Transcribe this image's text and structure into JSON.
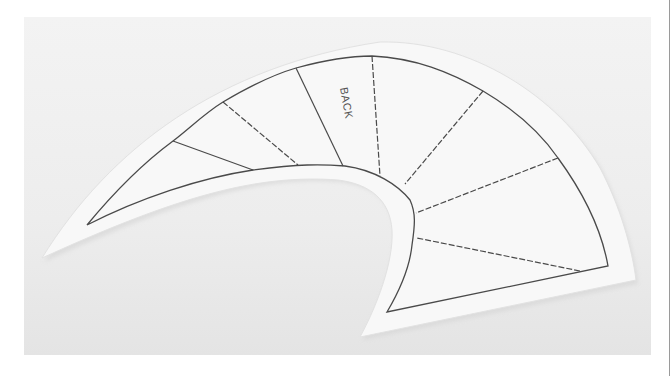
{
  "image": {
    "subject": "felt pattern piece with stitched sections",
    "pattern_label": "BACK",
    "colors": {
      "background": "#ededed",
      "felt": "#f8f8f8",
      "stitch_line": "#4a4a4a"
    }
  }
}
